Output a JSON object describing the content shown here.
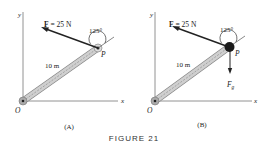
{
  "figure": {
    "caption": "FIGURE 21",
    "panels": [
      {
        "id": "A",
        "label": "(A)",
        "axis_x": "x",
        "axis_y": "y",
        "origin": "O",
        "point": "P",
        "force_label_bold": "F",
        "force_label_rest": " = 25 N",
        "angle": "125°",
        "length": "10 m"
      },
      {
        "id": "B",
        "label": "(B)",
        "axis_x": "x",
        "axis_y": "y",
        "origin": "O",
        "point": "P",
        "force_label_bold": "F",
        "force_label_rest": " = 25 N",
        "angle": "125°",
        "length": "10 m",
        "gravity_label": "F",
        "gravity_sub": "g"
      }
    ],
    "colors": {
      "rod_fill": "#c8c8c8",
      "rod_edge": "#888888",
      "ink": "#222222",
      "mass": "#1a1a1a"
    }
  }
}
